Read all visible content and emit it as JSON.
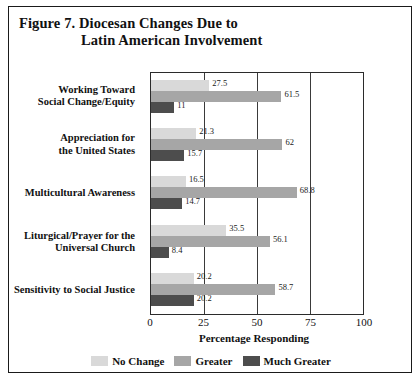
{
  "figure": {
    "title_line1": "Figure 7.  Diocesan Changes Due to",
    "title_line2": "Latin American Involvement"
  },
  "chart_data": {
    "type": "bar",
    "orientation": "horizontal",
    "title": "Figure 7. Diocesan Changes Due to Latin American Involvement",
    "xlabel": "Percentage Responding",
    "ylabel": "",
    "xlim": [
      0,
      100
    ],
    "xticks": [
      "0",
      "25",
      "50",
      "75",
      "100"
    ],
    "xtick_values": [
      0,
      25,
      50,
      75,
      100
    ],
    "grid": "vertical gridlines at 25, 50, 75",
    "legend_position": "bottom-center",
    "categories": [
      "Working Toward Social Change/Equity",
      "Appreciation for the United States",
      "Multicultural Awareness",
      "Liturgical/Prayer for the Universal Church",
      "Sensitivity to Social Justice"
    ],
    "category_lines": [
      [
        "Working Toward",
        "Social Change/Equity"
      ],
      [
        "Appreciation for",
        "the United States"
      ],
      [
        "Multicultural Awareness"
      ],
      [
        "Liturgical/Prayer for the",
        "Universal Church"
      ],
      [
        "Sensitivity to Social Justice"
      ]
    ],
    "series": [
      {
        "name": "No Change",
        "color": "#d9d9d9",
        "values": [
          27.5,
          21.3,
          16.5,
          35.5,
          20.2
        ],
        "labels": [
          "27.5",
          "21.3",
          "16.5",
          "35.5",
          "20.2"
        ]
      },
      {
        "name": "Greater",
        "color": "#a6a6a6",
        "values": [
          61.5,
          62,
          68.8,
          56.1,
          58.7
        ],
        "labels": [
          "61.5",
          "62",
          "68.8",
          "56.1",
          "58.7"
        ]
      },
      {
        "name": "Much Greater",
        "color": "#4d4d4d",
        "values": [
          11,
          15.7,
          14.7,
          8.4,
          20.2
        ],
        "labels": [
          "11",
          "15.7",
          "14.7",
          "8.4",
          "20.2"
        ]
      }
    ]
  }
}
